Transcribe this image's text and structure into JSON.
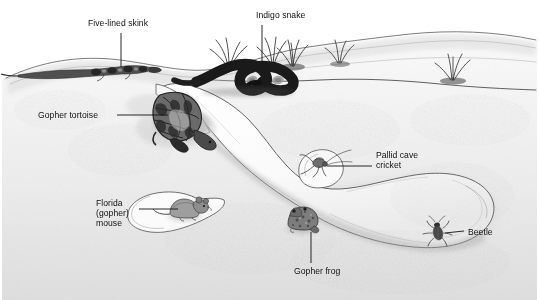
{
  "figure": {
    "type": "scientific-illustration",
    "background_color": "#ffffff",
    "ink_color": "#2b2b2b",
    "sand_color": "#e9e9e9",
    "width": 539,
    "height": 300
  },
  "labels": [
    {
      "id": "five-lined-skink",
      "text": "Five-lined skink",
      "lines": [
        "Five-lined skink"
      ],
      "x": 88,
      "y": 22,
      "leader": {
        "from_x": 121,
        "from_y": 33,
        "to_x": 121,
        "to_y": 67
      }
    },
    {
      "id": "indigo-snake",
      "text": "Indigo snake",
      "lines": [
        "Indigo snake"
      ],
      "x": 256,
      "y": 14,
      "leader": {
        "from_x": 262,
        "from_y": 25,
        "to_x": 262,
        "to_y": 62
      }
    },
    {
      "id": "gopher-tortoise",
      "text": "Gopher tortoise",
      "lines": [
        "Gopher tortoise"
      ],
      "x": 38,
      "y": 108,
      "leader": {
        "from_x": 117,
        "from_y": 115,
        "to_x": 168,
        "to_y": 115
      }
    },
    {
      "id": "pallid-cave-cricket",
      "text": "Pallid cave cricket",
      "lines": [
        "Pallid cave",
        "cricket"
      ],
      "x": 376,
      "y": 150,
      "leader": {
        "from_x": 372,
        "from_y": 166,
        "to_x": 327,
        "to_y": 166
      }
    },
    {
      "id": "florida-gopher-mouse",
      "text": "Florida (gopher) mouse",
      "lines": [
        "Florida",
        "(gopher)",
        "mouse"
      ],
      "x": 99,
      "y": 203,
      "leader": {
        "from_x": 139,
        "from_y": 209,
        "to_x": 178,
        "to_y": 209
      }
    },
    {
      "id": "gopher-frog",
      "text": "Gopher frog",
      "lines": [
        "Gopher frog"
      ],
      "x": 298,
      "y": 265,
      "leader": {
        "from_x": 311,
        "from_y": 263,
        "to_x": 311,
        "to_y": 232
      }
    },
    {
      "id": "beetle",
      "text": "Beetle",
      "lines": [
        "Beetle"
      ],
      "x": 468,
      "y": 226,
      "leader": {
        "from_x": 464,
        "from_y": 231,
        "to_x": 444,
        "to_y": 235
      }
    }
  ],
  "species": [
    {
      "id": "five-lined-skink",
      "common_name": "Five-lined skink",
      "location": "on ground surface, left"
    },
    {
      "id": "indigo-snake",
      "common_name": "Indigo snake",
      "location": "coiled on ground surface among grass tufts"
    },
    {
      "id": "gopher-tortoise",
      "common_name": "Gopher tortoise",
      "location": "burrow entrance / tunnel mouth"
    },
    {
      "id": "pallid-cave-cricket",
      "common_name": "Pallid cave cricket",
      "location": "upper side chamber of burrow"
    },
    {
      "id": "florida-gopher-mouse",
      "common_name": "Florida (gopher) mouse",
      "location": "left side chamber of burrow"
    },
    {
      "id": "gopher-frog",
      "common_name": "Gopher frog",
      "location": "mid lower tunnel"
    },
    {
      "id": "beetle",
      "common_name": "Beetle",
      "location": "far right end of burrow"
    }
  ],
  "scene": {
    "grass_tufts": 5,
    "ground_surface": "undulating sand dune profile",
    "burrow": "single long descending tunnel with three side chambers"
  }
}
